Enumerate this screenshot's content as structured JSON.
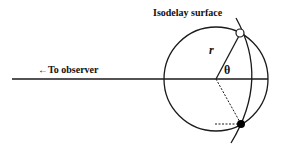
{
  "diagram": {
    "title_label": "Isodelay surface",
    "observer_label": "←To observer",
    "radius_label": "r",
    "angle_label": "θ",
    "colors": {
      "stroke": "#1a1a1a",
      "background": "#ffffff",
      "filled_point": "#000000",
      "open_point": "#ffffff"
    },
    "elements": [
      {
        "name": "sphere",
        "type": "circle"
      },
      {
        "name": "line-of-sight",
        "type": "line"
      },
      {
        "name": "isodelay-surface",
        "type": "curve"
      },
      {
        "name": "radius-vector",
        "type": "line"
      },
      {
        "name": "open-point",
        "type": "point",
        "fill": "open"
      },
      {
        "name": "filled-point",
        "type": "point",
        "fill": "solid"
      },
      {
        "name": "projection-dashed",
        "type": "dashed-line"
      }
    ]
  }
}
